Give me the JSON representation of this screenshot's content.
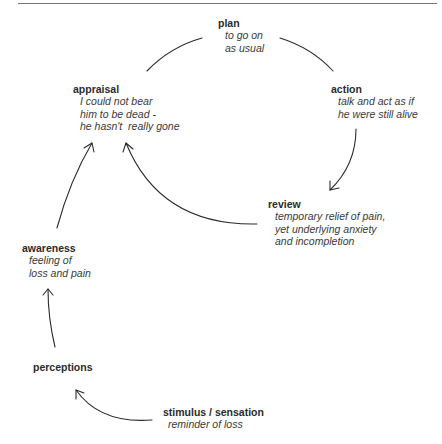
{
  "diagram": {
    "type": "cycle",
    "nodes": {
      "plan": {
        "title": "plan",
        "lines": [
          "to go on",
          "as usual"
        ]
      },
      "action": {
        "title": "action",
        "lines": [
          "talk and act as if",
          "he were still alive"
        ]
      },
      "review": {
        "title": "review",
        "lines": [
          "temporary relief of pain,",
          "yet underlying anxiety",
          "and incompletion"
        ]
      },
      "appraisal": {
        "title": "appraisal",
        "lines": [
          "I could not bear",
          "him to be dead -",
          "he hasn't  really gone"
        ]
      },
      "awareness": {
        "title": "awareness",
        "lines": [
          "feeling of",
          "loss and pain"
        ]
      },
      "perceptions": {
        "title": "perceptions",
        "lines": []
      },
      "stimulus": {
        "title": "stimulus / sensation",
        "lines": [
          "reminder of loss"
        ]
      }
    },
    "edges": [
      {
        "from": "stimulus",
        "to": "perceptions"
      },
      {
        "from": "perceptions",
        "to": "awareness"
      },
      {
        "from": "awareness",
        "to": "appraisal"
      },
      {
        "from": "appraisal",
        "to": "plan"
      },
      {
        "from": "plan",
        "to": "action"
      },
      {
        "from": "action",
        "to": "review"
      },
      {
        "from": "review",
        "to": "appraisal"
      }
    ],
    "colors": {
      "stroke": "#2a2a2a",
      "text": "#2b2b2b"
    }
  }
}
